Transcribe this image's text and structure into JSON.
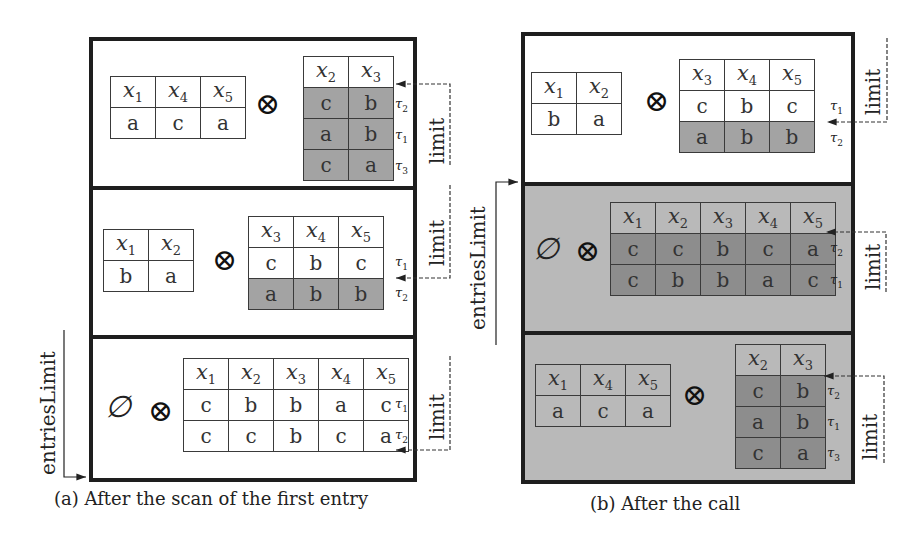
{
  "figure": {
    "panel_a": {
      "caption": "(a) After the scan of the first entry",
      "side_label": "entriesLimit",
      "sections": [
        {
          "left_relation": {
            "headers": [
              "x1",
              "x4",
              "x5"
            ],
            "rows": [
              [
                "a",
                "c",
                "a"
              ]
            ]
          },
          "operator": "⊗",
          "right_relation": {
            "headers": [
              "x2",
              "x3"
            ],
            "rows": [
              [
                "c",
                "b"
              ],
              [
                "a",
                "b"
              ],
              [
                "c",
                "a"
              ]
            ],
            "row_labels": [
              "τ2",
              "τ1",
              "τ3"
            ],
            "shaded_rows": [
              0,
              1,
              2
            ]
          },
          "limit_label": "limit"
        },
        {
          "left_relation": {
            "headers": [
              "x1",
              "x2"
            ],
            "rows": [
              [
                "b",
                "a"
              ]
            ]
          },
          "operator": "⊗",
          "right_relation": {
            "headers": [
              "x3",
              "x4",
              "x5"
            ],
            "rows": [
              [
                "c",
                "b",
                "c"
              ],
              [
                "a",
                "b",
                "b"
              ]
            ],
            "row_labels": [
              "τ1",
              "τ2"
            ],
            "shaded_rows": [
              1
            ]
          },
          "limit_label": "limit"
        },
        {
          "left_symbol": "∅",
          "operator": "⊗",
          "right_relation": {
            "headers": [
              "x1",
              "x2",
              "x3",
              "x4",
              "x5"
            ],
            "rows": [
              [
                "c",
                "b",
                "b",
                "a",
                "c"
              ],
              [
                "c",
                "c",
                "b",
                "c",
                "a"
              ]
            ],
            "row_labels": [
              "τ1",
              "τ2"
            ],
            "shaded_rows": []
          },
          "limit_label": "limit"
        }
      ]
    },
    "panel_b": {
      "caption": "(b) After the call",
      "side_label": "entriesLimit",
      "sections": [
        {
          "left_relation": {
            "headers": [
              "x1",
              "x2"
            ],
            "rows": [
              [
                "b",
                "a"
              ]
            ]
          },
          "operator": "⊗",
          "right_relation": {
            "headers": [
              "x3",
              "x4",
              "x5"
            ],
            "rows": [
              [
                "c",
                "b",
                "c"
              ],
              [
                "a",
                "b",
                "b"
              ]
            ],
            "row_labels": [
              "τ1",
              "τ2"
            ],
            "shaded_rows": [
              1
            ]
          },
          "limit_label": "limit"
        },
        {
          "left_symbol": "∅",
          "operator": "⊗",
          "right_relation": {
            "headers": [
              "x1",
              "x2",
              "x3",
              "x4",
              "x5"
            ],
            "rows": [
              [
                "c",
                "c",
                "b",
                "c",
                "a"
              ],
              [
                "c",
                "b",
                "b",
                "a",
                "c"
              ]
            ],
            "row_labels": [
              "τ2",
              "τ1"
            ],
            "shaded_rows": [
              0,
              1
            ]
          },
          "limit_label": "limit",
          "background": "gray"
        },
        {
          "left_relation": {
            "headers": [
              "x1",
              "x4",
              "x5"
            ],
            "rows": [
              [
                "a",
                "c",
                "a"
              ]
            ]
          },
          "operator": "⊗",
          "right_relation": {
            "headers": [
              "x2",
              "x3"
            ],
            "rows": [
              [
                "c",
                "b"
              ],
              [
                "a",
                "b"
              ],
              [
                "c",
                "a"
              ]
            ],
            "row_labels": [
              "τ2",
              "τ1",
              "τ3"
            ],
            "shaded_rows": [
              0,
              1,
              2
            ]
          },
          "limit_label": "limit",
          "background": "gray"
        }
      ]
    },
    "colors": {
      "border": "#1e1e1e",
      "panel_gray": "#b9b9b9",
      "shaded_cell_a": "#a3a3a3",
      "shaded_cell_b": "#8d8d8d"
    }
  }
}
